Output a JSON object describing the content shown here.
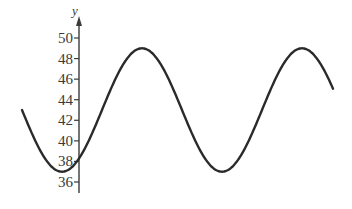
{
  "chart_data": {
    "type": "line",
    "title": "",
    "xlabel": "",
    "ylabel": "y",
    "ylim": [
      35,
      51
    ],
    "yticks": [
      36,
      38,
      40,
      42,
      44,
      46,
      48,
      50
    ],
    "ytick_labels": [
      "36",
      "38",
      "40",
      "42",
      "44",
      "46",
      "48",
      "50"
    ],
    "grid": false,
    "legend": null,
    "x_axis_visible": false,
    "series": [
      {
        "name": "curve",
        "color": "#2a2a2a",
        "midline": 43,
        "amplitude": 6,
        "max": 49,
        "min": 37,
        "points_px_x": [
          22,
          62,
          142,
          222,
          303,
          333
        ],
        "values": [
          43,
          37,
          49,
          37,
          49,
          45
        ]
      }
    ]
  },
  "axis": {
    "y_label": "y",
    "ticks": [
      {
        "label": "50",
        "value": 50
      },
      {
        "label": "48",
        "value": 48
      },
      {
        "label": "46",
        "value": 46
      },
      {
        "label": "44",
        "value": 44
      },
      {
        "label": "42",
        "value": 42
      },
      {
        "label": "40",
        "value": 40
      },
      {
        "label": "38",
        "value": 38
      },
      {
        "label": "36",
        "value": 36
      }
    ]
  }
}
